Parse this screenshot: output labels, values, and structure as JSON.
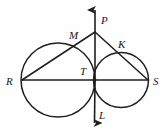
{
  "figure": {
    "background_color": "#fefefe",
    "stroke_color": "#1f1f1f",
    "label_color": "#1a1a1a"
  },
  "labels": {
    "p": "P",
    "m": "M",
    "k": "K",
    "r": "R",
    "t": "T",
    "s": "S",
    "l": "L"
  },
  "geometry": {
    "points": {
      "P_apex": {
        "x": 95,
        "y": 32
      },
      "P_arrow_tip": {
        "x": 95,
        "y": 5
      },
      "M": {
        "x": 78,
        "y": 45
      },
      "K": {
        "x": 119,
        "y": 54
      },
      "R": {
        "x": 22,
        "y": 80
      },
      "T": {
        "x": 95,
        "y": 80
      },
      "S": {
        "x": 148,
        "y": 80
      },
      "L_arrow_tip": {
        "x": 94,
        "y": 128
      }
    },
    "circles": [
      {
        "name": "left-circle",
        "cx": 58,
        "cy": 80,
        "r": 37
      },
      {
        "name": "right-circle",
        "cx": 121,
        "cy": 80,
        "r": 27.5
      }
    ],
    "segments": [
      {
        "name": "line-RS",
        "from": "R",
        "to": "S"
      },
      {
        "name": "line-RMP",
        "from": "R",
        "to": "P_apex"
      },
      {
        "name": "line-PKS",
        "from": "P_apex",
        "to": "S"
      },
      {
        "name": "line-PL",
        "from": "P_arrow_tip",
        "to": "L_arrow_tip"
      }
    ]
  },
  "label_positions": {
    "p": {
      "x": 101,
      "y": 15
    },
    "m": {
      "x": 69,
      "y": 30
    },
    "k": {
      "x": 118,
      "y": 39
    },
    "r": {
      "x": 6,
      "y": 76
    },
    "t": {
      "x": 80,
      "y": 66
    },
    "s": {
      "x": 153,
      "y": 76
    },
    "l": {
      "x": 99,
      "y": 110
    }
  }
}
